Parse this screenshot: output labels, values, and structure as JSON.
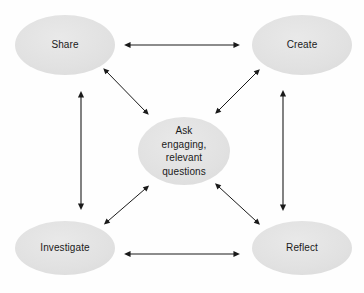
{
  "diagram": {
    "background_color": "#fefefe",
    "node_fill_color": "#e2e2e2",
    "arrow_color": "#1a1a1a",
    "text_color": "#1a1a1a",
    "nodes": [
      {
        "id": "share",
        "label": "Share",
        "role": "corner-node",
        "position": "top-left",
        "cx": 65,
        "cy": 45,
        "rx": 50,
        "ry": 30
      },
      {
        "id": "create",
        "label": "Create",
        "role": "corner-node",
        "position": "top-right",
        "cx": 302,
        "cy": 45,
        "rx": 50,
        "ry": 30
      },
      {
        "id": "center",
        "label": "Ask\nengaging,\nrelevant\nquestions",
        "role": "center-node",
        "position": "center",
        "cx": 184,
        "cy": 151,
        "rx": 46,
        "ry": 34
      },
      {
        "id": "investigate",
        "label": "Investigate",
        "role": "corner-node",
        "position": "bottom-left",
        "cx": 65,
        "cy": 248,
        "rx": 50,
        "ry": 27
      },
      {
        "id": "reflect",
        "label": "Reflect",
        "role": "corner-node",
        "position": "bottom-right",
        "cx": 302,
        "cy": 248,
        "rx": 50,
        "ry": 27
      }
    ],
    "connectors": [
      {
        "id": "share-create",
        "from": "share",
        "to": "create",
        "style": "double-headed",
        "orientation": "horizontal",
        "x1": 130,
        "y1": 45,
        "x2": 234,
        "y2": 45
      },
      {
        "id": "investigate-reflect",
        "from": "investigate",
        "to": "reflect",
        "style": "double-headed",
        "orientation": "horizontal",
        "x1": 130,
        "y1": 254,
        "x2": 234,
        "y2": 254
      },
      {
        "id": "share-investigate",
        "from": "share",
        "to": "investigate",
        "style": "double-headed",
        "orientation": "vertical",
        "x1": 81,
        "y1": 97,
        "x2": 81,
        "y2": 204
      },
      {
        "id": "create-reflect",
        "from": "create",
        "to": "reflect",
        "style": "double-headed",
        "orientation": "vertical",
        "x1": 283,
        "y1": 96,
        "x2": 283,
        "y2": 205
      },
      {
        "id": "share-center",
        "from": "share",
        "to": "center",
        "style": "double-headed",
        "orientation": "diagonal",
        "x1": 107,
        "y1": 72,
        "x2": 145,
        "y2": 111
      },
      {
        "id": "create-center",
        "from": "create",
        "to": "center",
        "style": "double-headed",
        "orientation": "diagonal",
        "x1": 256,
        "y1": 73,
        "x2": 219,
        "y2": 110
      },
      {
        "id": "investigate-center",
        "from": "investigate",
        "to": "center",
        "style": "double-headed",
        "orientation": "diagonal",
        "x1": 108,
        "y1": 221,
        "x2": 145,
        "y2": 189
      },
      {
        "id": "reflect-center",
        "from": "reflect",
        "to": "center",
        "style": "double-headed",
        "orientation": "diagonal",
        "x1": 256,
        "y1": 221,
        "x2": 219,
        "y2": 187
      }
    ]
  }
}
